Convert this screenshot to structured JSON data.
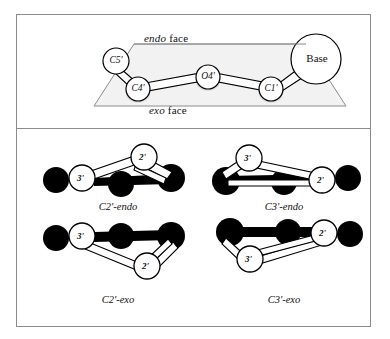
{
  "figure": {
    "type": "chemical-structure-diagram",
    "frame_color": "#8c8c8c",
    "background": "#ffffff"
  },
  "top_panel": {
    "name": "sugar-ring-plane-panel",
    "face_labels": {
      "endo": {
        "italic": "endo",
        "roman": " face"
      },
      "exo": {
        "italic": "exo",
        "roman": " face"
      }
    },
    "atoms": [
      {
        "id": "C5p",
        "label": "C5'",
        "kind": "open-circle",
        "x": 100,
        "y": 47,
        "r": 13
      },
      {
        "id": "C4p",
        "label": "C4'",
        "kind": "open-circle",
        "x": 122,
        "y": 75,
        "r": 12
      },
      {
        "id": "O4p",
        "label": "O4'",
        "kind": "open-circle",
        "x": 192,
        "y": 63,
        "r": 12
      },
      {
        "id": "C1p",
        "label": "C1'",
        "kind": "open-circle",
        "x": 255,
        "y": 75,
        "r": 12
      },
      {
        "id": "Base",
        "label": "Base",
        "kind": "large-open-circle",
        "x": 300,
        "y": 45,
        "r": 25
      }
    ],
    "plane": {
      "shape": "parallelogram",
      "fill": "#f2f2f2",
      "stroke": "#8c8c8c"
    }
  },
  "bottom_panel": {
    "name": "pucker-conformers-panel",
    "conformers": [
      {
        "id": "c2-endo",
        "caption": {
          "prefix": "C2'",
          "suffix": "-endo"
        },
        "pucker_atom": "C2'",
        "face": "endo",
        "labelled_atoms": [
          {
            "label": "3'",
            "position": "left-baseline"
          },
          {
            "label": "2'",
            "position": "right-raised-above-plane"
          }
        ],
        "dark_atoms": 3
      },
      {
        "id": "c3-endo",
        "caption": {
          "prefix": "C3'",
          "suffix": "-endo"
        },
        "pucker_atom": "C3'",
        "face": "endo",
        "labelled_atoms": [
          {
            "label": "3'",
            "position": "left-raised-above-plane"
          },
          {
            "label": "2'",
            "position": "right-baseline"
          }
        ],
        "dark_atoms": 3
      },
      {
        "id": "c2-exo",
        "caption": {
          "prefix": "C2'",
          "suffix": "-exo"
        },
        "pucker_atom": "C2'",
        "face": "exo",
        "labelled_atoms": [
          {
            "label": "3'",
            "position": "left-baseline"
          },
          {
            "label": "2'",
            "position": "right-dropped-below-plane"
          }
        ],
        "dark_atoms": 3
      },
      {
        "id": "c3-exo",
        "caption": {
          "prefix": "C3'",
          "suffix": "-exo"
        },
        "pucker_atom": "C3'",
        "face": "exo",
        "labelled_atoms": [
          {
            "label": "3'",
            "position": "left-dropped-below-plane"
          },
          {
            "label": "2'",
            "position": "right-baseline"
          }
        ],
        "dark_atoms": 3
      }
    ]
  },
  "colors": {
    "dark_atom": "#000000",
    "open_atom": "#ffffff",
    "bond_stroke": "#000000",
    "plane_fill": "#f2f2f2",
    "frame": "#8c8c8c"
  }
}
